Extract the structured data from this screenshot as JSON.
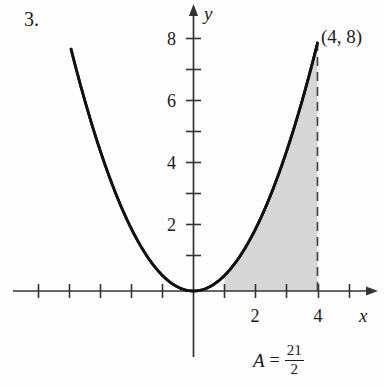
{
  "figure": {
    "problem_number": "3.",
    "point_label": "(4, 8)",
    "area_label": {
      "symbol": "A",
      "equals": "=",
      "numerator": "21",
      "denominator": "2"
    },
    "axis_labels": {
      "x": "x",
      "y": "y"
    },
    "colors": {
      "curve": "#111111",
      "axis": "#333333",
      "shading": "#d6d6d6",
      "dashed": "#444444",
      "text": "#1a1a1a"
    }
  },
  "chart_data": {
    "type": "line",
    "title": "",
    "subtitle": "",
    "xlabel": "x",
    "ylabel": "y",
    "xlim": [
      -5.8,
      5.9
    ],
    "ylim": [
      -2.2,
      9.2
    ],
    "grid": false,
    "legend_position": "none",
    "function": "y = x^2 / 2",
    "x_ticks_major": [
      2,
      4
    ],
    "x_tick_labels_major": [
      "2",
      "4"
    ],
    "x_ticks_minor": [
      -5,
      -4,
      -3,
      -2,
      -1,
      1,
      3,
      5
    ],
    "y_ticks_major": [
      2,
      4,
      6,
      8
    ],
    "y_tick_labels_major": [
      "2",
      "4",
      "6",
      "8"
    ],
    "y_ticks_minor": [
      1,
      3,
      5,
      7
    ],
    "series": [
      {
        "name": "y = x^2/2",
        "x": [
          -3.95,
          -3.5,
          -3.0,
          -2.5,
          -2.0,
          -1.5,
          -1.0,
          -0.5,
          0.0,
          0.5,
          1.0,
          1.5,
          2.0,
          2.5,
          3.0,
          3.5,
          4.0
        ],
        "values": [
          7.8,
          6.125,
          4.5,
          3.125,
          2.0,
          1.125,
          0.5,
          0.125,
          0.0,
          0.125,
          0.5,
          1.125,
          2.0,
          3.125,
          4.5,
          6.125,
          8.0
        ]
      }
    ],
    "annotations": [
      {
        "text": "(4, 8)",
        "x": 4,
        "y": 8,
        "type": "point-label"
      },
      {
        "text": "A = 21/2",
        "x": 3.0,
        "y": -1.8,
        "type": "area-value"
      }
    ],
    "shaded_region": {
      "x_from": 1,
      "x_to": 4,
      "upper": "y = x^2/2",
      "lower": "y = 0",
      "area": 10.5,
      "fill": "#d6d6d6"
    },
    "dashed_lines": [
      {
        "x": 4,
        "y_from": 0,
        "y_to": 8
      }
    ]
  }
}
